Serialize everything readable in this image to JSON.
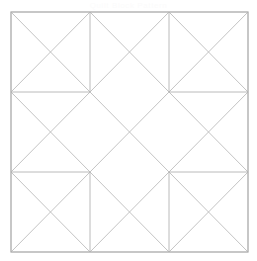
{
  "document": {
    "title": "Quilt Block Pattern Diagram",
    "caption": "Quilt Block Pattern",
    "background_color": "#ffffff"
  },
  "diagram": {
    "name": "nine-patch-diagonal-quilt-block",
    "outer_frame": {
      "x": 11,
      "y": 12,
      "width": 237,
      "height": 240,
      "stroke_color": "#9a9a9a",
      "stroke_width": 1.1,
      "fill": "#ffffff"
    },
    "grid": {
      "rows": 3,
      "columns": 3,
      "cell_width": 79,
      "cell_height": 80,
      "x_positions": [
        11,
        90,
        169,
        248
      ],
      "y_positions": [
        12,
        92,
        172,
        252
      ]
    },
    "line_styles": {
      "frame_stroke": "#9a9a9a",
      "grid_stroke": "#a8a8a8",
      "diagonal_stroke": "#b4b4b4",
      "diagonal_stroke_dark": "#8f8f8f",
      "stroke_width_frame": 1.1,
      "stroke_width_grid": 0.8,
      "stroke_width_diagonal": 0.8
    },
    "cells": [
      {
        "id": "cell-r1c1",
        "row": 1,
        "col": 1,
        "position": "top-left",
        "motif": "hourglass-x",
        "diagonals": [
          "main",
          "anti"
        ]
      },
      {
        "id": "cell-r1c2",
        "row": 1,
        "col": 2,
        "position": "top-center",
        "motif": "hourglass-x",
        "diagonals": [
          "main",
          "anti"
        ]
      },
      {
        "id": "cell-r1c3",
        "row": 1,
        "col": 3,
        "position": "top-right",
        "motif": "hourglass-x",
        "diagonals": [
          "main",
          "anti"
        ]
      },
      {
        "id": "cell-r2c1",
        "row": 2,
        "col": 1,
        "position": "middle-left",
        "motif": "hourglass-x",
        "diagonals": [
          "main",
          "anti"
        ]
      },
      {
        "id": "cell-r2c2",
        "row": 2,
        "col": 2,
        "position": "center",
        "motif": "hourglass-x",
        "diagonals": [
          "main",
          "anti"
        ]
      },
      {
        "id": "cell-r2c3",
        "row": 2,
        "col": 3,
        "position": "middle-right",
        "motif": "hourglass-x",
        "diagonals": [
          "main",
          "anti"
        ]
      },
      {
        "id": "cell-r3c1",
        "row": 3,
        "col": 1,
        "position": "bottom-left",
        "motif": "hourglass-x",
        "diagonals": [
          "main",
          "anti"
        ]
      },
      {
        "id": "cell-r3c2",
        "row": 3,
        "col": 2,
        "position": "bottom-center",
        "motif": "hourglass-x",
        "diagonals": [
          "main",
          "anti"
        ]
      },
      {
        "id": "cell-r3c3",
        "row": 3,
        "col": 3,
        "position": "bottom-right",
        "motif": "hourglass-x",
        "diagonals": [
          "main",
          "anti"
        ]
      }
    ],
    "grid_segments": [
      {
        "id": "seg-top-left-vertical",
        "orientation": "vertical",
        "x1": 90,
        "y1": 12,
        "x2": 90,
        "y2": 92
      },
      {
        "id": "seg-top-left-horizontal",
        "orientation": "horizontal",
        "x1": 11,
        "y1": 92,
        "x2": 90,
        "y2": 92
      },
      {
        "id": "seg-top-right-vertical",
        "orientation": "vertical",
        "x1": 169,
        "y1": 12,
        "x2": 169,
        "y2": 92
      },
      {
        "id": "seg-top-right-horizontal",
        "orientation": "horizontal",
        "x1": 169,
        "y1": 92,
        "x2": 248,
        "y2": 92
      },
      {
        "id": "seg-bottom-left-vertical",
        "orientation": "vertical",
        "x1": 90,
        "y1": 172,
        "x2": 90,
        "y2": 252
      },
      {
        "id": "seg-bottom-left-horizontal",
        "orientation": "horizontal",
        "x1": 11,
        "y1": 172,
        "x2": 90,
        "y2": 172
      },
      {
        "id": "seg-bottom-right-vertical",
        "orientation": "vertical",
        "x1": 169,
        "y1": 172,
        "x2": 169,
        "y2": 252
      },
      {
        "id": "seg-bottom-right-horizontal",
        "orientation": "horizontal",
        "x1": 169,
        "y1": 172,
        "x2": 248,
        "y2": 172
      }
    ],
    "center_diamond": {
      "id": "center-on-point-diamond",
      "points": "90,92 169,92 169,172 90,172",
      "note": "central square unit reading as an on-point diamond through the surrounding diagonals"
    }
  }
}
